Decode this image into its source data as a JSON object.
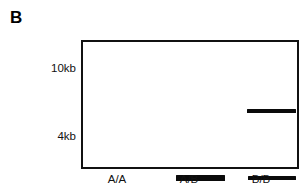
{
  "figure": {
    "panel_letter": "B",
    "type": "gel-electrophoresis-diagram",
    "background_color": "#ffffff",
    "border_color": "#111111",
    "band_color": "#0a0a0a"
  },
  "gel": {
    "size_markers": [
      {
        "label": "10kb",
        "value_kb": 10
      },
      {
        "label": "4kb",
        "value_kb": 4
      }
    ],
    "lanes": [
      {
        "label": "A/A",
        "genotype": "A/A",
        "bands": [
          {
            "marker": "4kb",
            "intensity": "strong"
          }
        ]
      },
      {
        "label": "A/B",
        "genotype": "A/B",
        "bands": [
          {
            "marker": "10kb",
            "intensity": "normal"
          },
          {
            "marker": "4kb",
            "intensity": "normal"
          }
        ]
      },
      {
        "label": "B/B",
        "genotype": "B/B",
        "bands": [
          {
            "marker": "10kb",
            "intensity": "strong"
          }
        ]
      }
    ]
  }
}
